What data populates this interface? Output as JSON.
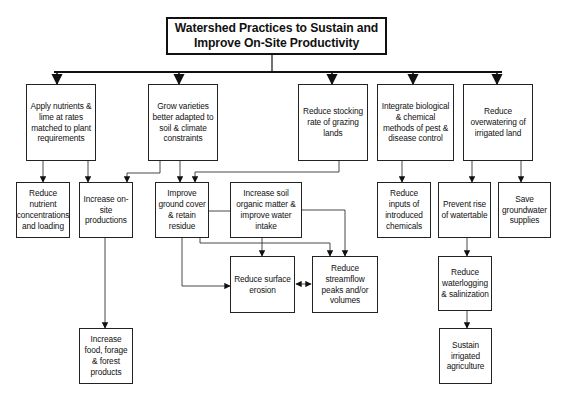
{
  "title": "Watershed Practices to Sustain and Improve On-Site Productivity",
  "nodes": {
    "title": {
      "label": "Watershed Practices to Sustain and\nImprove On-Site Productivity",
      "x": 166,
      "y": 17,
      "w": 221,
      "h": 38
    },
    "apply_nutrients": {
      "label": "Apply nutrients & lime at rates matched to plant requirements",
      "x": 26,
      "y": 84,
      "w": 70,
      "h": 77
    },
    "grow_varieties": {
      "label": "Grow varieties better adapted to soil & climate constraints",
      "x": 148,
      "y": 84,
      "w": 70,
      "h": 77
    },
    "reduce_stocking": {
      "label": "Reduce stocking rate of grazing lands",
      "x": 298,
      "y": 84,
      "w": 70,
      "h": 77
    },
    "integrate_pest": {
      "label": "Integrate biological & chemical methods of pest & disease control",
      "x": 377,
      "y": 84,
      "w": 77,
      "h": 77
    },
    "reduce_overwatering": {
      "label": "Reduce overwatering of irrigated land",
      "x": 463,
      "y": 84,
      "w": 70,
      "h": 77
    },
    "reduce_nutrient_conc": {
      "label": "Reduce nutrient concentrations and loading",
      "x": 16,
      "y": 182,
      "w": 54,
      "h": 56
    },
    "increase_onsite": {
      "label": "Increase on-site productions",
      "x": 79,
      "y": 182,
      "w": 54,
      "h": 56
    },
    "improve_ground_cover": {
      "label": "Improve ground cover & retain residue",
      "x": 155,
      "y": 182,
      "w": 54,
      "h": 56
    },
    "increase_soil_om": {
      "label": "Increase soil organic matter & improve water intake",
      "x": 230,
      "y": 182,
      "w": 72,
      "h": 56
    },
    "reduce_inputs_chem": {
      "label": "Reduce inputs of introduced chemicals",
      "x": 377,
      "y": 182,
      "w": 54,
      "h": 56
    },
    "prevent_watertable": {
      "label": "Prevent rise of watertable",
      "x": 438,
      "y": 182,
      "w": 53,
      "h": 56
    },
    "save_groundwater": {
      "label": "Save groundwater supplies",
      "x": 498,
      "y": 182,
      "w": 53,
      "h": 56
    },
    "reduce_erosion": {
      "label": "Reduce surface erosion",
      "x": 230,
      "y": 256,
      "w": 65,
      "h": 57
    },
    "reduce_streamflow": {
      "label": "Reduce streamflow peaks and/or volumes",
      "x": 312,
      "y": 256,
      "w": 66,
      "h": 57
    },
    "reduce_waterlogging": {
      "label": "Reduce waterlogging & salinization",
      "x": 438,
      "y": 256,
      "w": 54,
      "h": 55
    },
    "increase_food": {
      "label": "Increase food, forage & forest products",
      "x": 79,
      "y": 328,
      "w": 54,
      "h": 56
    },
    "sustain_irrigated": {
      "label": "Sustain irrigated agriculture",
      "x": 439,
      "y": 328,
      "w": 53,
      "h": 56
    }
  },
  "edges": [
    {
      "from": "title",
      "to": "apply_nutrients"
    },
    {
      "from": "title",
      "to": "grow_varieties"
    },
    {
      "from": "title",
      "to": "reduce_stocking"
    },
    {
      "from": "title",
      "to": "integrate_pest"
    },
    {
      "from": "title",
      "to": "reduce_overwatering"
    },
    {
      "from": "apply_nutrients",
      "to": "reduce_nutrient_conc"
    },
    {
      "from": "apply_nutrients",
      "to": "increase_onsite"
    },
    {
      "from": "grow_varieties",
      "to": "increase_onsite"
    },
    {
      "from": "grow_varieties",
      "to": "improve_ground_cover"
    },
    {
      "from": "reduce_stocking",
      "to": "improve_ground_cover"
    },
    {
      "from": "integrate_pest",
      "to": "reduce_inputs_chem"
    },
    {
      "from": "reduce_overwatering",
      "to": "prevent_watertable"
    },
    {
      "from": "reduce_overwatering",
      "to": "save_groundwater"
    },
    {
      "from": "improve_ground_cover",
      "to": "increase_soil_om"
    },
    {
      "from": "improve_ground_cover",
      "to": "reduce_erosion"
    },
    {
      "from": "improve_ground_cover",
      "to": "reduce_streamflow"
    },
    {
      "from": "increase_soil_om",
      "to": "reduce_erosion"
    },
    {
      "from": "increase_soil_om",
      "to": "reduce_streamflow"
    },
    {
      "from": "reduce_erosion",
      "to": "reduce_streamflow",
      "bidirectional": true
    },
    {
      "from": "increase_onsite",
      "to": "increase_food"
    },
    {
      "from": "prevent_watertable",
      "to": "reduce_waterlogging"
    },
    {
      "from": "reduce_waterlogging",
      "to": "sustain_irrigated"
    }
  ]
}
